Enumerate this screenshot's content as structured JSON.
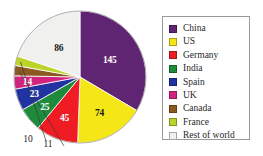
{
  "chart_data": {
    "type": "pie",
    "title": "",
    "subtitle": "",
    "xlabel": "",
    "ylabel": "",
    "total": 433,
    "legend_position": "right",
    "grid": false,
    "start_angle_deg": 0,
    "direction": "clockwise",
    "categories": [
      "China",
      "US",
      "Germany",
      "India",
      "Spain",
      "UK",
      "Canada",
      "France",
      "Rest of world"
    ],
    "values": [
      145,
      74,
      45,
      25,
      23,
      14,
      11,
      10,
      86
    ],
    "colors": [
      "#5f2472",
      "#f5e617",
      "#ef1c24",
      "#1d8a3c",
      "#2033a0",
      "#d0247f",
      "#8a5a20",
      "#bcd42a",
      "#f0f0ee"
    ],
    "slices": [
      {
        "label": "China",
        "value": 145,
        "color": "#5f2472",
        "label_color": "#ffffff",
        "label_placement": "inside"
      },
      {
        "label": "US",
        "value": 74,
        "color": "#f5e617",
        "label_color": "#1a1a1a",
        "label_placement": "inside"
      },
      {
        "label": "Germany",
        "value": 45,
        "color": "#ef1c24",
        "label_color": "#ffffff",
        "label_placement": "inside"
      },
      {
        "label": "India",
        "value": 25,
        "color": "#1d8a3c",
        "label_color": "#ffffff",
        "label_placement": "inside"
      },
      {
        "label": "Spain",
        "value": 23,
        "color": "#2033a0",
        "label_color": "#ffffff",
        "label_placement": "inside"
      },
      {
        "label": "UK",
        "value": 14,
        "color": "#d0247f",
        "label_color": "#ffffff",
        "label_placement": "inside"
      },
      {
        "label": "Canada",
        "value": 11,
        "color": "#8a5a20",
        "label_color": "#1a1a1a",
        "label_placement": "callout"
      },
      {
        "label": "France",
        "value": 10,
        "color": "#bcd42a",
        "label_color": "#1a1a1a",
        "label_placement": "callout"
      },
      {
        "label": "Rest of world",
        "value": 86,
        "color": "#f0f0ee",
        "label_color": "#1a1a1a",
        "label_placement": "inside"
      }
    ]
  },
  "pie": {
    "labels": {
      "china": "145",
      "us": "74",
      "germany": "45",
      "india": "25",
      "spain": "23",
      "uk": "14",
      "canada": "11",
      "france": "10",
      "rest_of_world": "86"
    }
  },
  "legend": {
    "items": [
      {
        "label": "China",
        "color": "#5f2472"
      },
      {
        "label": "US",
        "color": "#f5e617"
      },
      {
        "label": "Germany",
        "color": "#ef1c24"
      },
      {
        "label": "India",
        "color": "#1d8a3c"
      },
      {
        "label": "Spain",
        "color": "#2033a0"
      },
      {
        "label": "UK",
        "color": "#d0247f"
      },
      {
        "label": "Canada",
        "color": "#8a5a20"
      },
      {
        "label": "France",
        "color": "#bcd42a"
      },
      {
        "label": "Rest of world",
        "color": "#f0f0ee"
      }
    ]
  }
}
